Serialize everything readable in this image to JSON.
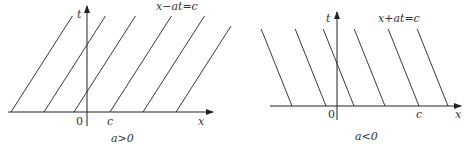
{
  "panels": [
    {
      "id": "left",
      "equation": "x−at=c",
      "caption": "a>0",
      "x_axis_label": "x",
      "t_axis_label": "t",
      "origin_label": "0",
      "c_label": "c",
      "slope_direction": "positive",
      "lines_count": 6
    },
    {
      "id": "right",
      "equation": "x+at=c",
      "caption": "a<0",
      "x_axis_label": "x",
      "t_axis_label": "t",
      "origin_label": "0",
      "c_label": "c",
      "slope_direction": "negative",
      "lines_count": 6
    }
  ]
}
